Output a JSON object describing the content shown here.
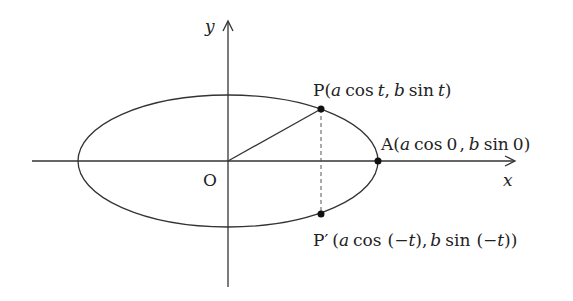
{
  "diagram": {
    "type": "ellipse-parametric",
    "axes": {
      "x_label": "x",
      "y_label": "y",
      "origin_label": "O"
    },
    "points": {
      "P": {
        "name": "P",
        "open": "(",
        "a": "a",
        "cos": "cos",
        "t1": "t",
        "comma": ",",
        "b": "b",
        "sin": "sin",
        "t2": "t",
        "close": ")"
      },
      "A": {
        "name": "A",
        "open": "(",
        "a": "a",
        "cos": "cos",
        "v1": "0",
        "comma": ",",
        "b": "b",
        "sin": "sin",
        "v2": "0",
        "close": ")"
      },
      "Pprime": {
        "name": "P′",
        "open": "(",
        "a": "a",
        "cos": "cos",
        "arg1_open": "(−",
        "t1": "t",
        "arg1_close": "),",
        "b": "b",
        "sin": "sin",
        "arg2_open": "(−",
        "t2": "t",
        "arg2_close": "))"
      }
    },
    "colors": {
      "stroke": "#333333",
      "background": "#ffffff"
    }
  }
}
